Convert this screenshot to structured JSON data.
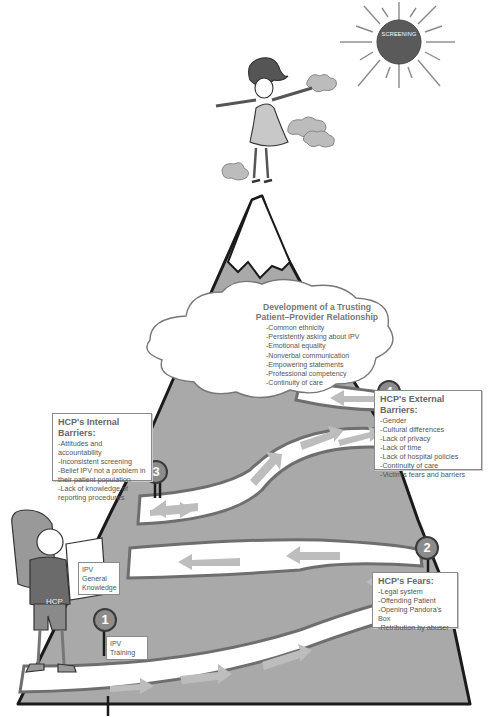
{
  "sun": {
    "label": "SCREENING",
    "color": "#5a5a5a"
  },
  "cloud": {
    "title_line1": "Development of a Trusting",
    "title_line2": "Patient–Provider Relationship",
    "items": [
      "-Common ethnicity",
      "-Persistently asking about IPV",
      "-Emotional equality",
      "-Nonverbal communication",
      "-Empowering statements",
      "-Professional competency",
      "-Continuity of care"
    ]
  },
  "markers": {
    "m1": "1",
    "m2": "2",
    "m3": "3",
    "m4": "4"
  },
  "internal_barriers": {
    "title": "HCP's Internal Barriers:",
    "items": [
      "-Attitudes and accountability",
      "-Inconsistent screening",
      "-Belief IPV not a problem in",
      "their patient population",
      "-Lack of knowledge of",
      "reporting procedures"
    ]
  },
  "external_barriers": {
    "title": "HCP's External Barriers:",
    "items": [
      "-Gender",
      "-Cultural differences",
      "-Lack of privacy",
      "-Lack of time",
      "-Lack of hospital policies",
      "-Continuity of care",
      "-Victim's fears and barriers"
    ]
  },
  "fears": {
    "title": "HCP's Fears:",
    "items": [
      "-Legal system",
      "-Offending Patient",
      "-Opening Pandora's Box",
      "-Retribution by abuser"
    ]
  },
  "hiker": {
    "shirt_label": "HCP",
    "map_label_line1": "IPV General",
    "map_label_line2": "Knowledge"
  },
  "step1_label": "IPV Training",
  "colors": {
    "mountain": "#a9a9a9",
    "outline": "#1a1a1a",
    "road": "#ffffff",
    "road_edge": "#6e6e6e",
    "arrow": "#bdbdbd",
    "marker": "#8c8c8c"
  }
}
